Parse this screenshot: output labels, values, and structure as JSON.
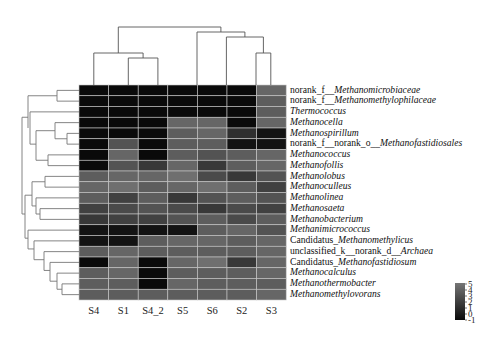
{
  "chart_data": {
    "type": "heatmap",
    "title": "",
    "xlabel": "",
    "ylabel": "",
    "columns": [
      "S4",
      "S1",
      "S4_2",
      "S5",
      "S6",
      "S2",
      "S3"
    ],
    "rows": [
      {
        "prefix": "norank_f__",
        "name": "Methanomicrobiaceae"
      },
      {
        "prefix": "norank_f__",
        "name": "Methanomethylophilaceae"
      },
      {
        "prefix": "",
        "name": "Thermococcus"
      },
      {
        "prefix": "",
        "name": "Methanocella"
      },
      {
        "prefix": "",
        "name": "Methanospirillum"
      },
      {
        "prefix": "norank_f__norank_o__",
        "name": "Methanofastidiosales"
      },
      {
        "prefix": "",
        "name": "Methanococcus"
      },
      {
        "prefix": "",
        "name": "Methanofollis"
      },
      {
        "prefix": "",
        "name": "Methanolobus"
      },
      {
        "prefix": "",
        "name": "Methanoculleus"
      },
      {
        "prefix": "",
        "name": "Methanolinea"
      },
      {
        "prefix": "",
        "name": "Methanosaeta"
      },
      {
        "prefix": "",
        "name": "Methanobacterium"
      },
      {
        "prefix": "",
        "name": "Methanimicrococcus"
      },
      {
        "prefix": "Candidatus_",
        "name": "Methanomethylicus"
      },
      {
        "prefix": "unclassified_k__norank_d__",
        "name": "Archaea"
      },
      {
        "prefix": "Candidatus_",
        "name": "Methanofastidiosum"
      },
      {
        "prefix": "",
        "name": "Methanocalculus"
      },
      {
        "prefix": "",
        "name": "Methanothermobacter"
      },
      {
        "prefix": "",
        "name": "Methanomethylovorans"
      }
    ],
    "values": [
      [
        -1,
        -1,
        -1,
        -1,
        -1,
        -1,
        4
      ],
      [
        -1,
        -1,
        -1,
        -1,
        -1,
        -1,
        3.5
      ],
      [
        -1,
        -1,
        -1,
        -1,
        -1,
        -1,
        3.5
      ],
      [
        -1,
        -1,
        -1,
        4,
        4,
        -1,
        4
      ],
      [
        -1,
        -1,
        -1,
        3.5,
        4,
        1,
        -0.5
      ],
      [
        -1,
        3,
        -1,
        3.5,
        3.5,
        -0.5,
        -0.5
      ],
      [
        -1,
        4,
        -1,
        3.5,
        3,
        3.5,
        4
      ],
      [
        -1,
        3,
        1.5,
        4,
        1.5,
        3.5,
        4
      ],
      [
        3.5,
        4,
        4,
        4.5,
        2.5,
        1.5,
        3
      ],
      [
        4,
        4.5,
        3.5,
        4,
        4.5,
        3.5,
        2
      ],
      [
        3.5,
        2,
        3.5,
        1.5,
        3,
        3.5,
        3
      ],
      [
        2,
        2.5,
        3,
        2.5,
        1.5,
        2.5,
        2
      ],
      [
        1.5,
        2,
        2,
        3,
        3.5,
        2.5,
        3.5
      ],
      [
        -0.5,
        -0.5,
        -0.5,
        -0.5,
        3.5,
        4,
        3
      ],
      [
        -0.5,
        -0.5,
        3.5,
        4,
        4,
        3.5,
        4
      ],
      [
        3.5,
        4,
        3.5,
        3.5,
        3.5,
        3.5,
        4
      ],
      [
        -1,
        4,
        -1,
        4,
        4.5,
        1.5,
        4
      ],
      [
        3.5,
        4,
        -1,
        3.5,
        3.5,
        3.5,
        4
      ],
      [
        3.5,
        3.5,
        -1,
        4,
        3.5,
        3.5,
        3.5
      ],
      [
        3.5,
        3.5,
        3.5,
        3.5,
        3.5,
        3.5,
        4
      ]
    ],
    "colorbar": {
      "ticks": [
        "5",
        "4",
        "3",
        "2",
        "1",
        "0",
        "-1"
      ],
      "range": [
        -1,
        5
      ],
      "low_color": "#0a0a0a",
      "high_color": "#767676"
    },
    "dendrograms": {
      "top": true,
      "left": true
    },
    "grid": false,
    "legend_position": "bottom-right"
  }
}
